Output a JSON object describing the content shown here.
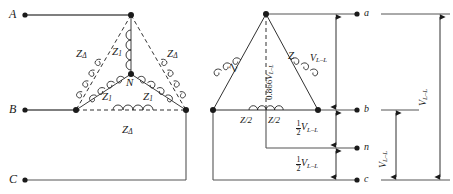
{
  "figure": {
    "type": "circuit-diagram",
    "background": "#ffffff",
    "line_color": "#1a1a1a"
  },
  "left_network": {
    "name": "delta-wye-superimposed",
    "terminals": [
      {
        "id": "A",
        "label": "A"
      },
      {
        "id": "B",
        "label": "B"
      },
      {
        "id": "C",
        "label": "C"
      }
    ],
    "neutral": {
      "id": "N",
      "label": "N"
    },
    "delta_impedances": [
      {
        "id": "z-delta-left",
        "label": "Z",
        "subscript": "Δ"
      },
      {
        "id": "z-delta-right",
        "label": "Z",
        "subscript": "Δ"
      },
      {
        "id": "z-delta-bottom",
        "label": "Z",
        "subscript": "Δ"
      }
    ],
    "wye_impedances": [
      {
        "id": "z1-top",
        "label": "Z",
        "subscript": "1"
      },
      {
        "id": "z1-lower-left",
        "label": "Z",
        "subscript": "1"
      },
      {
        "id": "z1-lower-right",
        "label": "Z",
        "subscript": "1"
      }
    ]
  },
  "right_network": {
    "name": "open-delta-with-center-tap",
    "terminals": [
      {
        "id": "a",
        "label": "a"
      },
      {
        "id": "b",
        "label": "b"
      },
      {
        "id": "n",
        "label": "n"
      },
      {
        "id": "c",
        "label": "c"
      }
    ],
    "impedances": [
      {
        "id": "z-left",
        "label": "Z"
      },
      {
        "id": "z-right",
        "label": "Z"
      },
      {
        "id": "z-half-left",
        "label": "Z/2"
      },
      {
        "id": "z-half-right",
        "label": "Z/2"
      }
    ],
    "altitude_label": {
      "id": "altitude",
      "coefficient": "0.866",
      "symbol": "V",
      "subscript": "L–L"
    }
  },
  "dimensions": [
    {
      "id": "dim-a-b",
      "numerator": "",
      "denominator": "",
      "symbol": "V",
      "subscript": "L–L",
      "span": "a-to-b"
    },
    {
      "id": "dim-b-n",
      "numerator": "1",
      "denominator": "2",
      "symbol": "V",
      "subscript": "L–L",
      "span": "b-to-n"
    },
    {
      "id": "dim-n-c",
      "numerator": "1",
      "denominator": "2",
      "symbol": "V",
      "subscript": "L–L",
      "span": "n-to-c"
    },
    {
      "id": "dim-outer-a-c",
      "numerator": "",
      "denominator": "",
      "symbol": "V",
      "subscript": "L–L",
      "span": "a-to-c"
    },
    {
      "id": "dim-outer-b-c",
      "numerator": "",
      "denominator": "",
      "symbol": "V",
      "subscript": "L–L",
      "span": "b-to-c"
    }
  ]
}
